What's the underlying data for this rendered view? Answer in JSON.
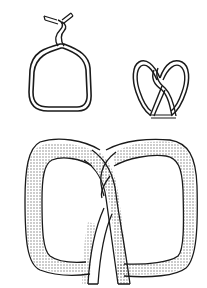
{
  "figure": {
    "colors": {
      "background": "#ffffff",
      "ink": "#1a1a1a",
      "stipple": "#333333"
    },
    "steps": [
      {
        "id": "step-1",
        "description": "dough rope formed into a loop with ends twisted at top"
      },
      {
        "id": "step-2",
        "description": "small pretzel with ends crossed and pressed down"
      },
      {
        "id": "step-3",
        "description": "finished pretzel, shaded"
      }
    ]
  }
}
